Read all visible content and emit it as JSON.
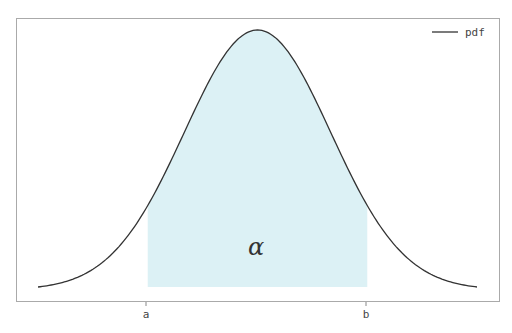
{
  "chart_data": {
    "type": "area",
    "title": "",
    "xlabel": "",
    "ylabel": "",
    "series": [
      {
        "name": "pdf",
        "kind": "line",
        "color": "#333333",
        "distribution": "normal",
        "mean": 0,
        "std": 1,
        "x_range": [
          -3,
          3
        ]
      }
    ],
    "shaded_region": {
      "from_label": "a",
      "to_label": "b",
      "from": -1.5,
      "to": 1.5,
      "color": "#d8f0f4",
      "annotation": "α"
    },
    "x_ticks": [
      "a",
      "b"
    ],
    "y_ticks": [],
    "grid": false,
    "legend": {
      "position": "upper right",
      "entries": [
        "pdf"
      ]
    }
  },
  "legend": {
    "label": "pdf"
  },
  "ticks": {
    "a": "a",
    "b": "b"
  },
  "annotation": {
    "alpha": "α"
  },
  "colors": {
    "curve": "#333333",
    "fill": "#d8f0f4",
    "axis": "#999999"
  }
}
